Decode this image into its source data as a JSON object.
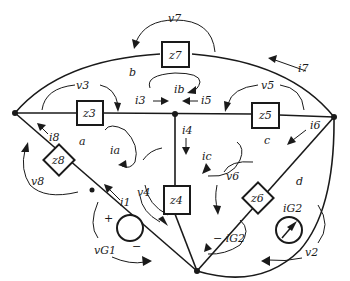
{
  "diagram": {
    "type": "circuit-network",
    "elements": {
      "z7": "z7",
      "z3": "z3",
      "z5": "z5",
      "z4": "z4",
      "z8": "z8",
      "z6": "z6"
    },
    "meshes": {
      "a": "a",
      "b": "b",
      "c": "c",
      "d": "d"
    },
    "labels": {
      "v7": "v7",
      "v3": "v3",
      "v5": "v5",
      "v4": "v4",
      "v6": "v6",
      "v8": "v8",
      "v2": "v2",
      "vG1": "vG1",
      "i7": "i7",
      "i3": "i3",
      "i5": "i5",
      "ib": "ib",
      "i4": "i4",
      "i6": "i6",
      "i8": "i8",
      "i1": "i1",
      "ia": "ia",
      "ic": "ic",
      "iG2": "iG2",
      "neg_iG2": "− iG2",
      "plus": "+",
      "minus": "−"
    }
  }
}
